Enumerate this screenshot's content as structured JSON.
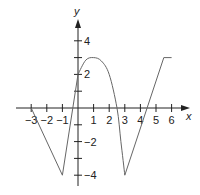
{
  "chart_data": {
    "type": "line",
    "title": "",
    "xlabel": "x",
    "ylabel": "y",
    "xlim": [
      -3.5,
      6.5
    ],
    "ylim": [
      -4.5,
      4.5
    ],
    "x_ticks": [
      -3,
      -2,
      -1,
      1,
      2,
      3,
      4,
      5,
      6
    ],
    "x_tick_labels": [
      "−3",
      "−2",
      "−1",
      "1",
      "2",
      "3",
      "4",
      "5",
      "6"
    ],
    "y_ticks": [
      -4,
      -3,
      -2,
      -1,
      1,
      2,
      3,
      4
    ],
    "y_tick_labels": {
      "4": "4",
      "2": "2",
      "-2": "−2",
      "-4": "−4"
    },
    "grid": false,
    "series": [
      {
        "name": "f",
        "segments": [
          {
            "kind": "line",
            "points": [
              [
                -3,
                0
              ],
              [
                -1,
                -4
              ],
              [
                0,
                2
              ]
            ]
          },
          {
            "kind": "curve",
            "points": [
              [
                0,
                2
              ],
              [
                0.5,
                2.85
              ],
              [
                1,
                3
              ],
              [
                1.5,
                2.8
              ],
              [
                2,
                2
              ],
              [
                2.5,
                0
              ],
              [
                2.75,
                -2
              ],
              [
                3,
                -4
              ]
            ]
          },
          {
            "kind": "line",
            "points": [
              [
                3,
                -4
              ],
              [
                5.5,
                3
              ],
              [
                6,
                3
              ]
            ]
          }
        ]
      }
    ]
  }
}
